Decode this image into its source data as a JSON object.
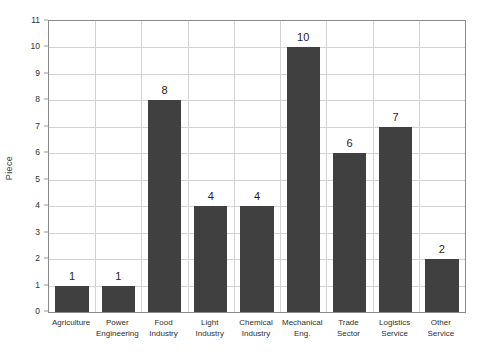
{
  "chart_data": {
    "type": "bar",
    "title": "",
    "xlabel": "",
    "ylabel": "Piece",
    "ylim": [
      0,
      11
    ],
    "ytick_step": 1,
    "yticks": [
      "0",
      "1",
      "2",
      "3",
      "4",
      "5",
      "6",
      "7",
      "8",
      "9",
      "10",
      "11"
    ],
    "grid": "both",
    "legend": "none",
    "bar_color": "#404040",
    "grid_color": "#d2d2d2",
    "axis_color": "#8a8a8a",
    "categories": [
      "Agriculture",
      "Power\nEngineering",
      "Food\nIndustry",
      "Light\nIndustry",
      "Chemical\nIndustry",
      "Mechanical\nEng.",
      "Trade\nSector",
      "Logistics\nService",
      "Other\nService"
    ],
    "values": [
      1,
      1,
      8,
      4,
      4,
      10,
      6,
      7,
      2
    ],
    "data_labels": [
      "1",
      "1",
      "8",
      "4",
      "4",
      "10",
      "6",
      "7",
      "2"
    ]
  }
}
